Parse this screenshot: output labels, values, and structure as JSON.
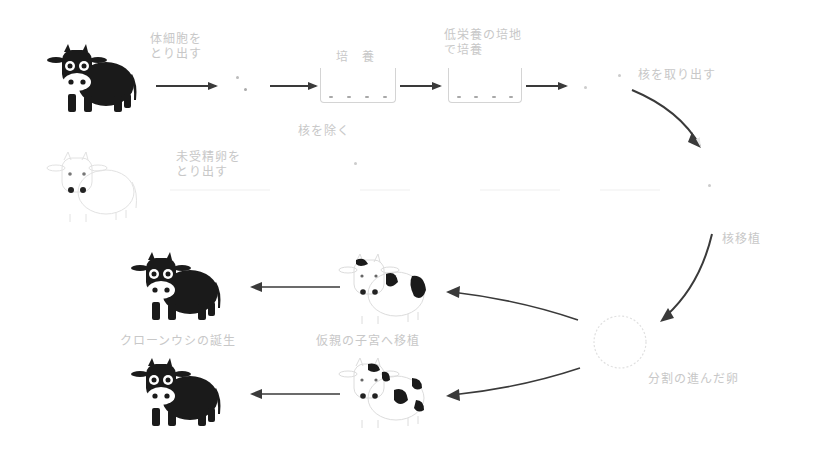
{
  "diagram": {
    "colors": {
      "arrow": "#3a3a3a",
      "label": "#c8c8c8",
      "cow_black": "#1a1a1a",
      "faint": "#e0e0e0"
    },
    "row1": {
      "donor_cow": "donor-cow-black",
      "step1_label": "体細胞を\nとり出す",
      "dish1_label": "培　養",
      "dish2_label": "低栄養の培地\nで培養",
      "step4_label": "核を取り出す"
    },
    "row2": {
      "egg_cow": "egg-donor-cow-white",
      "step1_label": "未受精卵を\nとり出す",
      "step2_label": "核を除く"
    },
    "right": {
      "transplant_label": "核移植",
      "egg_label": "分割の進んだ卵"
    },
    "row3": {
      "surrogate_label": "仮親の子宮へ移植",
      "result_label": "クローンウシの誕生"
    }
  }
}
